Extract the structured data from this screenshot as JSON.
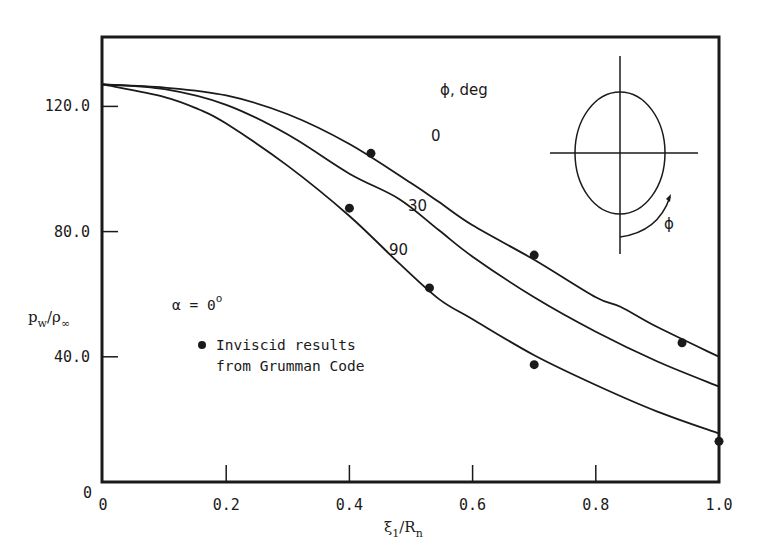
{
  "chart_data": {
    "type": "line",
    "title": "",
    "xlabel": "ξ1/Rn",
    "ylabel": "pw/ρ∞",
    "xlim": [
      0,
      1.0
    ],
    "ylim": [
      0,
      140
    ],
    "grid": false,
    "x_ticks": [
      "0",
      "0.2",
      "0.4",
      "0.6",
      "0.8",
      "1.0"
    ],
    "x_tick_values": [
      0,
      0.2,
      0.4,
      0.6,
      0.8,
      1.0
    ],
    "y_ticks": [
      "0",
      "40.0",
      "80.0",
      "120.0"
    ],
    "y_tick_values": [
      0,
      40,
      80,
      120
    ],
    "legend_title": "ϕ, deg",
    "series": [
      {
        "name": "ϕ = 0 deg",
        "label": "0",
        "x": [
          0,
          0.1,
          0.2,
          0.3,
          0.4,
          0.5,
          0.545,
          0.6,
          0.7,
          0.8,
          0.84,
          0.9,
          1.0
        ],
        "values": [
          127,
          126,
          123.5,
          117.5,
          108,
          95.5,
          89.5,
          82,
          71,
          59,
          56,
          49.5,
          40
        ]
      },
      {
        "name": "ϕ = 30 deg",
        "label": "30",
        "x": [
          0,
          0.1,
          0.2,
          0.3,
          0.4,
          0.48,
          0.545,
          0.6,
          0.7,
          0.8,
          0.9,
          1.0
        ],
        "values": [
          127,
          125.5,
          120.5,
          111,
          98.5,
          90.5,
          80.5,
          72,
          59,
          48,
          38.5,
          30.5
        ]
      },
      {
        "name": "ϕ = 90 deg",
        "label": "90",
        "x": [
          0,
          0.1,
          0.156,
          0.2,
          0.3,
          0.4,
          0.48,
          0.545,
          0.6,
          0.7,
          0.8,
          0.9,
          1.0
        ],
        "values": [
          127,
          123,
          119,
          114.5,
          101,
          85,
          70,
          58.5,
          52,
          40.5,
          31,
          22.5,
          15.5
        ]
      }
    ],
    "scatter": {
      "name": "Inviscid results from Grumman Code",
      "points": [
        {
          "x": 0.435,
          "y": 105
        },
        {
          "x": 0.4,
          "y": 87.5
        },
        {
          "x": 0.53,
          "y": 62
        },
        {
          "x": 0.7,
          "y": 72.5
        },
        {
          "x": 0.7,
          "y": 37.5
        },
        {
          "x": 0.94,
          "y": 44.5
        },
        {
          "x": 1.0,
          "y": 13
        }
      ]
    },
    "annotations": {
      "alpha": "α = 0°",
      "legend_marker_text_line1": "Inviscid results",
      "legend_marker_text_line2": "from Grumman Code",
      "inset_diagram": "ellipse cross-section with ϕ angle measured from bottom",
      "inset_phi_label": "ϕ"
    }
  },
  "labels": {
    "legend_title": "ϕ, deg",
    "alpha_prefix": "α = 0",
    "alpha_sup": "o",
    "legend_line1": "Inviscid results",
    "legend_line2": "from Grumman Code",
    "ylabel_main": "p",
    "ylabel_sub1": "w",
    "ylabel_slash": "/ρ",
    "ylabel_sub2": "∞",
    "xlabel_main": "ξ",
    "xlabel_sub1": "1",
    "xlabel_slash": "/R",
    "xlabel_sub2": "n",
    "curve_label_0": "0",
    "curve_label_30": "30",
    "curve_label_90": "90",
    "inset_phi": "ϕ",
    "y_zero": "0"
  },
  "colors": {
    "ink": "#1a1a1a",
    "background": "#ffffff"
  }
}
